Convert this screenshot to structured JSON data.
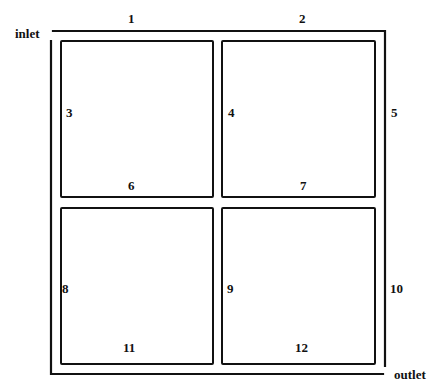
{
  "diagram": {
    "type": "flow-channel-layout",
    "ports": {
      "inlet": "inlet",
      "outlet": "outlet"
    },
    "segment_labels": [
      "1",
      "2",
      "3",
      "4",
      "5",
      "6",
      "7",
      "8",
      "9",
      "10",
      "11",
      "12"
    ],
    "blocks": [
      {
        "id": "top-left"
      },
      {
        "id": "top-right"
      },
      {
        "id": "bottom-left"
      },
      {
        "id": "bottom-right"
      }
    ],
    "line_color": "#111111"
  }
}
